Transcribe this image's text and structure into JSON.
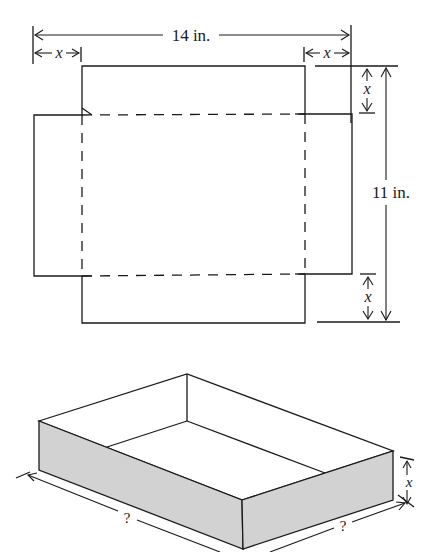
{
  "figure": {
    "flat_template": {
      "width_label": "14 in.",
      "height_label": "11 in.",
      "corner_cut_label_top_left": "x",
      "corner_cut_label_top_right": "x",
      "corner_cut_label_right_top": "x",
      "corner_cut_label_right_bottom": "x",
      "fold_line_style": "dashed"
    },
    "folded_box": {
      "length_label": "?",
      "width_label": "?",
      "height_label": "x",
      "side_fill_color": "#d2d2d2"
    }
  }
}
